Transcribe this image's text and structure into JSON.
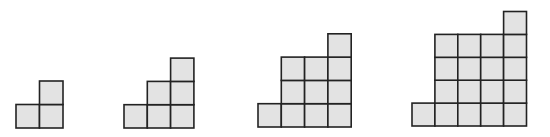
{
  "diagram": {
    "cell_fill": "#e3e3e3",
    "cell_stroke": "#222222",
    "figures": [
      {
        "name": "figure-1",
        "column_heights": [
          1,
          2
        ],
        "total_squares": 3
      },
      {
        "name": "figure-2",
        "column_heights": [
          1,
          2,
          3
        ],
        "total_squares": 6
      },
      {
        "name": "figure-3",
        "column_heights": [
          1,
          3,
          3,
          4
        ],
        "total_squares": 11
      },
      {
        "name": "figure-4",
        "column_heights": [
          1,
          4,
          4,
          4,
          5
        ],
        "total_squares": 18
      }
    ]
  }
}
